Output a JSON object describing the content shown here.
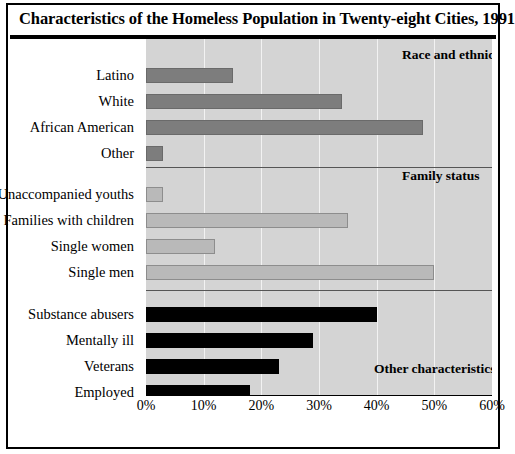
{
  "title": "Characteristics of the Homeless Population in Twenty-eight Cities, 1991",
  "axis": {
    "ticks": [
      "0%",
      "10%",
      "20%",
      "30%",
      "40%",
      "50%",
      "60%"
    ]
  },
  "groups": [
    {
      "label": "Race and ethnicity"
    },
    {
      "label": "Family status"
    },
    {
      "label": "Other characteristics"
    }
  ],
  "categories": [
    "Latino",
    "White",
    "African American",
    "Other",
    "Unaccompanied youths",
    "Families with children",
    "Single women",
    "Single men",
    "Substance abusers",
    "Mentally ill",
    "Veterans",
    "Employed"
  ],
  "colors": {
    "race": "#7d7d7d",
    "family": "#b9b9b9",
    "other": "#000000",
    "plot_background": "#d4d4d4",
    "gridline": "#f2f2f2",
    "separator": "#555555"
  },
  "chart_data": {
    "type": "bar",
    "orientation": "horizontal",
    "title": "Characteristics of the Homeless Population in Twenty-eight Cities, 1991",
    "xlabel": "",
    "ylabel": "",
    "xlim": [
      0,
      60
    ],
    "xticks": [
      0,
      10,
      20,
      30,
      40,
      50,
      60
    ],
    "xtick_labels": [
      "0%",
      "10%",
      "20%",
      "30%",
      "40%",
      "50%",
      "60%"
    ],
    "grid": true,
    "legend": "none",
    "units": "percent",
    "groups": [
      {
        "name": "Race and ethnicity",
        "color": "#7d7d7d",
        "categories": [
          "Latino",
          "White",
          "African American",
          "Other"
        ],
        "values": [
          15,
          34,
          48,
          3
        ]
      },
      {
        "name": "Family status",
        "color": "#b9b9b9",
        "categories": [
          "Unaccompanied youths",
          "Families with children",
          "Single women",
          "Single men"
        ],
        "values": [
          3,
          35,
          12,
          50
        ]
      },
      {
        "name": "Other characteristics",
        "color": "#000000",
        "categories": [
          "Substance abusers",
          "Mentally ill",
          "Veterans",
          "Employed"
        ],
        "values": [
          40,
          29,
          23,
          18
        ]
      }
    ],
    "categories_flat": [
      "Latino",
      "White",
      "African American",
      "Other",
      "Unaccompanied youths",
      "Families with children",
      "Single women",
      "Single men",
      "Substance abusers",
      "Mentally ill",
      "Veterans",
      "Employed"
    ],
    "values_flat": [
      15,
      34,
      48,
      3,
      3,
      35,
      12,
      50,
      40,
      29,
      23,
      18
    ]
  },
  "layout": {
    "bar_rows_y": [
      29,
      55,
      81,
      107,
      148,
      174,
      200,
      226,
      268,
      294,
      320,
      346
    ],
    "separator_y": [
      128,
      251
    ],
    "group_label_pos": [
      {
        "x": 256,
        "y": 8
      },
      {
        "x": 256,
        "y": 129
      },
      {
        "x": 228,
        "y": 322
      }
    ]
  }
}
